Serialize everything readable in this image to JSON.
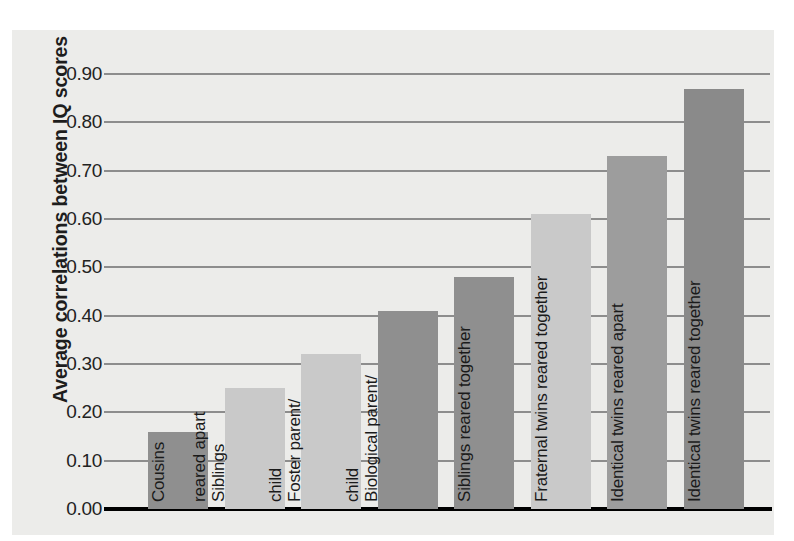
{
  "chart_data": {
    "type": "bar",
    "title": "",
    "xlabel": "",
    "ylabel": "Average correlations between IQ scores",
    "ylim": [
      0.0,
      0.9
    ],
    "grid": true,
    "legend": "none",
    "orientation": "vertical",
    "bar_label_placement": "inside-rotated-vertical",
    "ytick_labels": [
      "0.90",
      "0.80",
      "0.70",
      "0.60",
      "0.50",
      "0.40",
      "0.30",
      "0.20",
      "0.10",
      "0.00"
    ],
    "ytick_values": [
      0.9,
      0.8,
      0.7,
      0.6,
      0.5,
      0.4,
      0.3,
      0.2,
      0.1,
      0.0
    ],
    "categories": [
      "Cousins",
      "Siblings reared apart",
      "Foster parent/child",
      "Biological parent/child",
      "Siblings reared together",
      "Fraternal twins reared together",
      "Identical twins reared apart",
      "Identical twins reared together"
    ],
    "values": [
      0.16,
      0.25,
      0.32,
      0.41,
      0.48,
      0.61,
      0.73,
      0.87
    ],
    "bars": [
      {
        "label": "Cousins",
        "label_lines": [
          "Cousins"
        ],
        "value": 0.16,
        "color": "#8f8f8f"
      },
      {
        "label": "Siblings reared apart",
        "label_lines": [
          "Siblings",
          "reared apart"
        ],
        "value": 0.25,
        "color": "#c9c9c9"
      },
      {
        "label": "Foster parent/child",
        "label_lines": [
          "Foster parent/",
          "child"
        ],
        "value": 0.32,
        "color": "#c9c9c9"
      },
      {
        "label": "Biological parent/child",
        "label_lines": [
          "Biological parent/",
          "child"
        ],
        "value": 0.41,
        "color": "#8f8f8f"
      },
      {
        "label": "Siblings reared together",
        "label_lines": [
          "Siblings reared together"
        ],
        "value": 0.48,
        "color": "#8f8f8f"
      },
      {
        "label": "Fraternal twins reared together",
        "label_lines": [
          "Fraternal twins reared together"
        ],
        "value": 0.61,
        "color": "#c9c9c9"
      },
      {
        "label": "Identical twins reared apart",
        "label_lines": [
          "Identical twins reared apart"
        ],
        "value": 0.73,
        "color": "#9d9d9d"
      },
      {
        "label": "Identical twins reared together",
        "label_lines": [
          "Identical twins reared together"
        ],
        "value": 0.87,
        "color": "#8a8a8a"
      }
    ]
  },
  "colors": {
    "panel_background": "#ececea",
    "gridline": "#8d8d8d",
    "axis": "#000000",
    "text": "#1d1d1d",
    "bar_dark": "#8f8f8f",
    "bar_light": "#c9c9c9"
  }
}
